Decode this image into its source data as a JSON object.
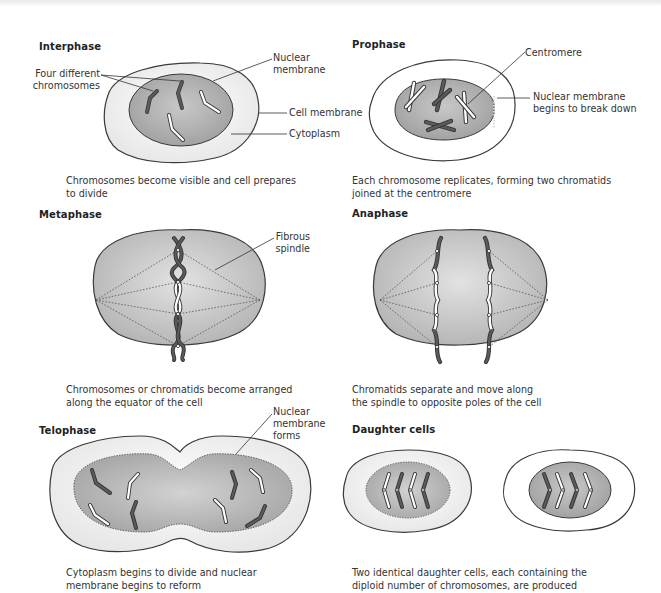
{
  "figure": {
    "topic": "Stages of mitosis",
    "colors": {
      "cell_fill": "#f1f1f1",
      "nucleus_fill": "#a9a9a9",
      "cytoplasm_dividing_fill": "#bdbdbd",
      "outline": "#3a3a3a",
      "chromosome_dark": "#555555",
      "chromosome_light": "#ffffff"
    }
  },
  "panels": [
    {
      "id": "interphase",
      "title": "Interphase",
      "caption": "Chromosomes become visible and cell prepares\nto divide",
      "labels": [
        {
          "id": "four-chromosomes",
          "text": "Four different\nchromosomes"
        },
        {
          "id": "nuclear-membrane",
          "text": "Nuclear\nmembrane"
        },
        {
          "id": "cell-membrane",
          "text": "Cell membrane"
        },
        {
          "id": "cytoplasm",
          "text": "Cytoplasm"
        }
      ]
    },
    {
      "id": "prophase",
      "title": "Prophase",
      "caption": "Each chromosome replicates, forming two chromatids\njoined at the centromere",
      "labels": [
        {
          "id": "centromere",
          "text": "Centromere"
        },
        {
          "id": "nuclear-membrane-breaks",
          "text": "Nuclear membrane\nbegins to break down"
        }
      ]
    },
    {
      "id": "metaphase",
      "title": "Metaphase",
      "caption": "Chromosomes or chromatids become arranged\nalong the equator of the cell",
      "labels": [
        {
          "id": "fibrous-spindle",
          "text": "Fibrous\nspindle"
        }
      ]
    },
    {
      "id": "anaphase",
      "title": "Anaphase",
      "caption": "Chromatids separate and move along\nthe spindle to opposite poles of the cell",
      "labels": []
    },
    {
      "id": "telophase",
      "title": "Telophase",
      "caption": "Cytoplasm begins to divide and nuclear\n membrane begins to reform",
      "labels": [
        {
          "id": "nuclear-membrane-forms",
          "text": "Nuclear\nmembrane\nforms"
        }
      ]
    },
    {
      "id": "daughter-cells",
      "title": "Daughter cells",
      "caption": "Two identical daughter cells, each containing the\ndiploid number of chromosomes, are produced",
      "labels": []
    }
  ]
}
